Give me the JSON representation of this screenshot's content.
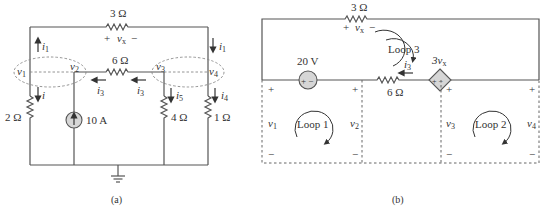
{
  "circuit_a": {
    "caption": "(a)",
    "r_top": "3 Ω",
    "vx_plus": "+",
    "vx_label": "v",
    "vx_sub": "x",
    "vx_minus": "−",
    "r_mid": "6 Ω",
    "r_left": "2 Ω",
    "current_source": "10 A",
    "r_4": "4 Ω",
    "r_1": "1 Ω",
    "nodes": {
      "v1": "v",
      "v1_sub": "1",
      "v2": "v",
      "v2_sub": "2",
      "v3": "v",
      "v3_sub": "3",
      "v4": "v",
      "v4_sub": "4"
    },
    "currents": {
      "i1_left": {
        "name": "i",
        "sub": "1"
      },
      "i1_right": {
        "name": "i",
        "sub": "1"
      },
      "i2": {
        "name": "i",
        "sub": "2"
      },
      "i3_left": {
        "name": "i",
        "sub": "3"
      },
      "i3_right": {
        "name": "i",
        "sub": "3"
      },
      "i4": {
        "name": "i",
        "sub": "4"
      },
      "i5": {
        "name": "i",
        "sub": "5"
      }
    }
  },
  "circuit_b": {
    "caption": "(b)",
    "r_top": "3 Ω",
    "vx_plus": "+",
    "vx_label": "v",
    "vx_sub": "x",
    "vx_minus": "−",
    "voltage_source": "20 V",
    "vs_polarity": "+ −",
    "r_mid": "6 Ω",
    "dep_source_label": "3v",
    "dep_source_sub": "x",
    "dep_polarity": "+ −",
    "i3": {
      "name": "i",
      "sub": "3"
    },
    "loops": [
      "Loop 1",
      "Loop 2",
      "Loop 3"
    ],
    "v1": {
      "name": "v",
      "sub": "1"
    },
    "v2": {
      "name": "v",
      "sub": "2"
    },
    "v3": {
      "name": "v",
      "sub": "3"
    },
    "v4": {
      "name": "v",
      "sub": "4"
    },
    "plus": "+",
    "minus": "−"
  },
  "colors": {
    "wire": "#555555",
    "source_fill": "#d6d6d6",
    "text": "#333333"
  }
}
